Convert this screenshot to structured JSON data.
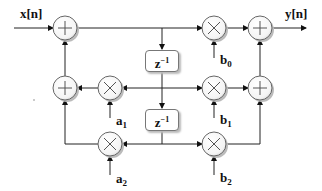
{
  "diagram": {
    "type": "block-diagram",
    "input_label": "x[n]",
    "output_label": "y[n]",
    "delays": [
      {
        "id": "delay-1",
        "label": "z",
        "exponent": "−1"
      },
      {
        "id": "delay-2",
        "label": "z",
        "exponent": "−1"
      }
    ],
    "feedback_coeffs": [
      {
        "id": "a1",
        "base": "a",
        "sub": "1"
      },
      {
        "id": "a2",
        "base": "a",
        "sub": "2"
      }
    ],
    "feedforward_coeffs": [
      {
        "id": "b0",
        "base": "b",
        "sub": "0"
      },
      {
        "id": "b1",
        "base": "b",
        "sub": "1"
      },
      {
        "id": "b2",
        "base": "b",
        "sub": "2"
      }
    ],
    "adders": [
      "input-adder",
      "feedback-adder",
      "output-adder",
      "feedforward-adder"
    ],
    "multipliers": [
      "mult-a1",
      "mult-a2",
      "mult-b0",
      "mult-b1",
      "mult-b2"
    ],
    "colors": {
      "line": "#222222",
      "node_border": "#666666",
      "node_shadow": "#bbbbbb",
      "background": "#ffffff"
    }
  }
}
